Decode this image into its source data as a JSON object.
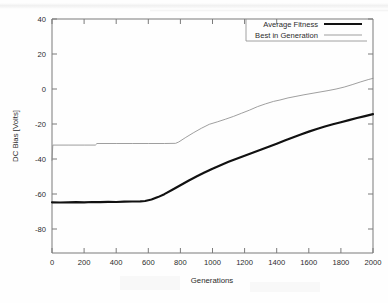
{
  "chart_data": {
    "type": "line",
    "title": "",
    "xlabel": "Generations",
    "ylabel": "DC Bias [Volts]",
    "xlim": [
      0,
      2000
    ],
    "ylim": [
      -94,
      40
    ],
    "xticks": [
      0,
      200,
      400,
      600,
      800,
      1000,
      1200,
      1400,
      1600,
      1800,
      2000
    ],
    "yticks": [
      40,
      20,
      0,
      -20,
      -40,
      -60,
      -80
    ],
    "xtick_labels": [
      "0",
      "200",
      "400",
      "600",
      "800",
      "1000",
      "1200",
      "1400",
      "1600",
      "1800",
      "2000"
    ],
    "ytick_labels": [
      "40",
      "20",
      "0",
      "-20",
      "-40",
      "-60",
      "-80"
    ],
    "grid": false,
    "legend_position": "top-right",
    "series": [
      {
        "name": "Average Fitness",
        "color": "#111111",
        "style": "thick-solid",
        "x": [
          0,
          50,
          100,
          150,
          200,
          250,
          300,
          350,
          400,
          450,
          500,
          550,
          580,
          620,
          660,
          700,
          750,
          800,
          850,
          900,
          950,
          1000,
          1050,
          1100,
          1150,
          1200,
          1250,
          1300,
          1350,
          1400,
          1450,
          1500,
          1550,
          1600,
          1650,
          1700,
          1750,
          1800,
          1850,
          1900,
          1950,
          2000
        ],
        "y": [
          -65.0,
          -65.1,
          -65.0,
          -64.9,
          -65.0,
          -64.8,
          -64.9,
          -64.7,
          -64.8,
          -64.6,
          -64.5,
          -64.4,
          -64.2,
          -63.4,
          -62.0,
          -60.3,
          -57.8,
          -55.2,
          -52.6,
          -50.2,
          -47.9,
          -45.7,
          -43.7,
          -41.8,
          -40.0,
          -38.3,
          -36.6,
          -34.9,
          -33.2,
          -31.4,
          -29.6,
          -27.8,
          -26.1,
          -24.5,
          -23.0,
          -21.6,
          -20.3,
          -19.1,
          -17.9,
          -16.7,
          -15.6,
          -14.5
        ]
      },
      {
        "name": "Best in Generation",
        "color": "#8e8e8e",
        "style": "thin-solid",
        "x": [
          0,
          5,
          100,
          200,
          270,
          280,
          400,
          500,
          600,
          700,
          770,
          790,
          830,
          880,
          930,
          980,
          1030,
          1080,
          1130,
          1180,
          1230,
          1280,
          1330,
          1380,
          1420,
          1470,
          1520,
          1570,
          1620,
          1670,
          1720,
          1770,
          1820,
          1870,
          1920,
          1970,
          2000
        ],
        "y": [
          -41.0,
          -32.2,
          -32.2,
          -32.2,
          -32.2,
          -31.3,
          -31.3,
          -31.3,
          -31.3,
          -31.3,
          -31.2,
          -30.4,
          -28.0,
          -25.2,
          -22.6,
          -20.3,
          -18.9,
          -17.4,
          -15.8,
          -14.0,
          -12.2,
          -10.2,
          -8.6,
          -7.2,
          -6.4,
          -5.2,
          -4.3,
          -3.4,
          -2.6,
          -1.8,
          -1.0,
          -0.1,
          1.0,
          2.4,
          3.9,
          5.3,
          6.0
        ]
      }
    ]
  },
  "legend": {
    "entries": [
      {
        "label": "Average Fitness"
      },
      {
        "label": "Best in Generation"
      }
    ]
  }
}
